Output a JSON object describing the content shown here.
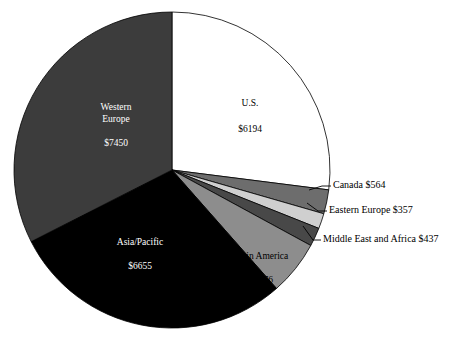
{
  "chart_data": {
    "type": "pie",
    "title": "",
    "subtitle": "",
    "xlabel": "",
    "ylabel": "",
    "legend_position": "none",
    "grid": false,
    "value_prefix": "$",
    "total": 22933,
    "start_angle_deg": 0,
    "direction": "clockwise",
    "categories": [
      "U.S.",
      "Canada",
      "Eastern Europe",
      "Middle East and Africa",
      "Latin America",
      "Asia/Pacific",
      "Western Europe"
    ],
    "values": [
      6194,
      564,
      357,
      437,
      1276,
      6655,
      7450
    ],
    "colors": [
      "#ffffff",
      "#6d6d6d",
      "#cfcfcf",
      "#484848",
      "#8d8d8d",
      "#000000",
      "#3c3c3c"
    ],
    "slices": [
      {
        "name": "U.S.",
        "value": 6194,
        "value_text": "$6194",
        "label": "U.S.",
        "label_lines": [
          "U.S."
        ],
        "color": "#ffffff",
        "text_color": "#000000",
        "label_placement": "inside",
        "sweep_deg": 97.2
      },
      {
        "name": "Canada",
        "value": 564,
        "value_text": "$564",
        "label": "Canada",
        "label_lines": [
          "Canada"
        ],
        "callout_text": "Canada   $564",
        "color": "#6d6d6d",
        "text_color": "#000000",
        "label_placement": "callout",
        "sweep_deg": 8.9
      },
      {
        "name": "Eastern Europe",
        "value": 357,
        "value_text": "$357",
        "label": "Eastern Europe",
        "label_lines": [
          "Eastern Europe"
        ],
        "callout_text": "Eastern Europe   $357",
        "color": "#cfcfcf",
        "text_color": "#000000",
        "label_placement": "callout",
        "sweep_deg": 5.6
      },
      {
        "name": "Middle East and Africa",
        "value": 437,
        "value_text": "$437",
        "label": "Middle East and Africa",
        "label_lines": [
          "Middle East and Africa"
        ],
        "callout_text": "Middle East and Africa   $437",
        "color": "#484848",
        "text_color": "#000000",
        "label_placement": "callout",
        "sweep_deg": 6.9
      },
      {
        "name": "Latin America",
        "value": 1276,
        "value_text": "$1276",
        "label": "Latin America",
        "label_lines": [
          "Latin America"
        ],
        "color": "#8d8d8d",
        "text_color": "#000000",
        "label_placement": "inside",
        "sweep_deg": 20.0
      },
      {
        "name": "Asia/Pacific",
        "value": 6655,
        "value_text": "$6655",
        "label": "Asia/Pacific",
        "label_lines": [
          "Asia/Pacific"
        ],
        "color": "#000000",
        "text_color": "#ffffff",
        "label_placement": "inside",
        "sweep_deg": 104.5
      },
      {
        "name": "Western Europe",
        "value": 7450,
        "value_text": "$7450",
        "label": "Western Europe",
        "label_lines": [
          "Western",
          "Europe"
        ],
        "color": "#3c3c3c",
        "text_color": "#ffffff",
        "label_placement": "inside",
        "sweep_deg": 116.9
      }
    ]
  },
  "labels": {
    "us_name": "U.S.",
    "us_value": "$6194",
    "western_europe_name_line1": "Western",
    "western_europe_name_line2": "Europe",
    "western_europe_value": "$7450",
    "asia_pacific_name": "Asia/Pacific",
    "asia_pacific_value": "$6655",
    "latin_america_name": "Latin America",
    "latin_america_value": "$1276",
    "canada_callout": "Canada   $564",
    "eastern_europe_callout": "Eastern Europe   $357",
    "middle_east_callout": "Middle East and Africa   $437"
  }
}
